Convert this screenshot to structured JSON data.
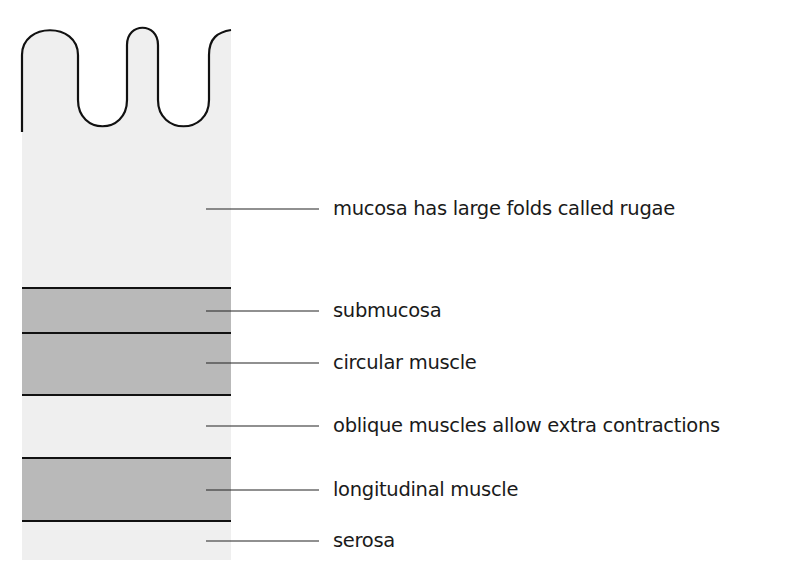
{
  "colors": {
    "light_layer": "#efefef",
    "dark_layer": "#b9b9b9",
    "line": "#111111"
  },
  "layers": [
    {
      "name": "mucosa",
      "label": "mucosa has large folds called rugae",
      "top": 30,
      "bottom": 288,
      "shade": "light",
      "label_y": 213
    },
    {
      "name": "submucosa",
      "label": "submucosa",
      "top": 288,
      "bottom": 333,
      "shade": "dark",
      "label_y": 311
    },
    {
      "name": "circular-muscle",
      "label": "circular muscle",
      "top": 333,
      "bottom": 395,
      "shade": "dark",
      "label_y": 363
    },
    {
      "name": "oblique-muscles",
      "label": "oblique muscles allow extra contractions",
      "top": 395,
      "bottom": 458,
      "shade": "light",
      "label_y": 427
    },
    {
      "name": "longitudinal-muscle",
      "label": "longitudinal muscle",
      "top": 458,
      "bottom": 521,
      "shade": "dark",
      "label_y": 490
    },
    {
      "name": "serosa",
      "label": "serosa",
      "top": 521,
      "bottom": 560,
      "shade": "light",
      "label_y": 544
    }
  ]
}
